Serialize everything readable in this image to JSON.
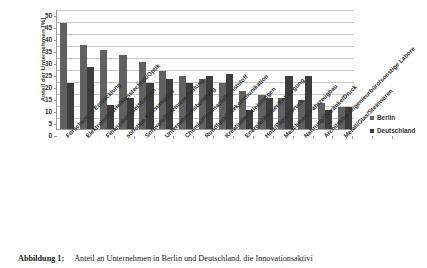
{
  "figure": {
    "caption_label": "Abbildung 1:",
    "caption_text": "Anteil an Unternehmen in Berlin und Deutschland, die Innovationsaktivi"
  },
  "chart_data": {
    "type": "bar",
    "title": "",
    "xlabel": "",
    "ylabel": "Anteil der Unternehmen [%]",
    "ylim": [
      0,
      50
    ],
    "ytick_step": 5,
    "yticks": [
      0,
      5,
      10,
      15,
      20,
      25,
      30,
      35,
      40,
      45,
      50
    ],
    "grid": true,
    "legend_position": "right",
    "categories": [
      "Forschung & Entwicklung",
      "Elektroindustrie/Messtechnik/Optik",
      "Finanzdienstleistungen",
      "sonstige Konsumgüter",
      "Software/Datenverarbeitung",
      "Unternehmensberatung",
      "Chemie/Pharmazie/Kunststoff",
      "Rundfunk/Telekommunikation",
      "Kreativdienstleistungen",
      "Energie/Wasser/Entsorgung",
      "Holz/Papier/Druck",
      "Maschinen-/Fahrzeugbau",
      "Nahrung/Getränke/Druck",
      "Architektur-/Ingenieurbüro/sonstige Labore",
      "Metall/Glas/Steinwaren"
    ],
    "series": [
      {
        "name": "Berlin",
        "color": "#616161",
        "values": [
          44,
          35,
          33,
          31,
          28,
          24,
          22,
          21,
          19,
          16,
          14,
          13,
          12,
          11,
          9
        ]
      },
      {
        "name": "Deutschland",
        "color": "#3d3d3d",
        "values": [
          19,
          26,
          10,
          13,
          19,
          21,
          19,
          22,
          23,
          8,
          13,
          22,
          22,
          8,
          9
        ]
      }
    ]
  }
}
